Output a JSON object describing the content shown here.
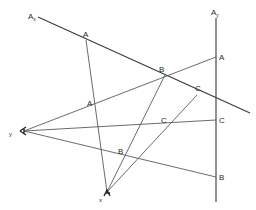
{
  "diagram": {
    "axes": {
      "ax": {
        "label": "A",
        "subscript": "x"
      },
      "ay": {
        "label": "A",
        "subscript": "y"
      }
    },
    "eye_points": {
      "y": {
        "label": "y"
      },
      "x": {
        "label": "x"
      }
    },
    "points_on_ax": [
      {
        "label": "A"
      },
      {
        "label": "B"
      },
      {
        "label": "C"
      }
    ],
    "points_on_ay": [
      {
        "label": "A"
      },
      {
        "label": "C"
      },
      {
        "label": "B"
      }
    ],
    "intersection_points": [
      {
        "label": "A"
      },
      {
        "label": "C"
      },
      {
        "label": "B"
      }
    ],
    "colors": {
      "line": "#5a5a5a",
      "text": "#2a2a2a",
      "background": "#ffffff"
    }
  }
}
